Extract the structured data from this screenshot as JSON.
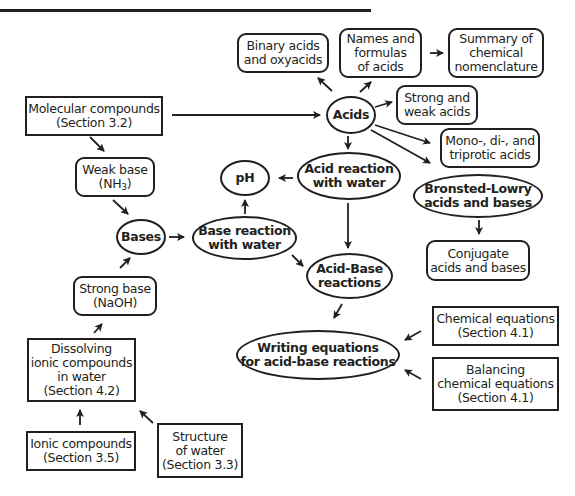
{
  "diagram": {
    "type": "concept-map",
    "nodes": {
      "binary_acids": "Binary acids\nand oxyacids",
      "names_formulas": "Names and\nformulas\nof acids",
      "summary_nomenclature": "Summary of\nchemical\nnomenclature",
      "molecular_compounds": "Molecular compounds\n(Section 3.2)",
      "acids": "Acids",
      "strong_weak_acids": "Strong and\nweak acids",
      "weak_base_label": "Weak base",
      "weak_base_formula_prefix": "(NH",
      "weak_base_formula_sub": "3",
      "weak_base_formula_suffix": ")",
      "ph": "pH",
      "acid_reaction_water": "Acid reaction\nwith water",
      "mono_di_triprotic": "Mono-, di-, and\ntriprotic acids",
      "bronsted_lowry": "Bronsted-Lowry\nacids and bases",
      "bases": "Bases",
      "base_reaction_water": "Base reaction\nwith water",
      "conjugate": "Conjugate\nacids and bases",
      "strong_base": "Strong base\n(NaOH)",
      "acid_base_reactions": "Acid-Base\nreactions",
      "chemical_equations": "Chemical equations\n(Section 4.1)",
      "dissolving_ionic": "Dissolving\nionic compounds\nin water\n(Section 4.2)",
      "writing_equations": "Writing equations\nfor acid-base reactions",
      "balancing_equations": "Balancing\nchemical equations\n(Section 4.1)",
      "ionic_compounds": "Ionic compounds\n(Section 3.5)",
      "structure_water": "Structure\nof water\n(Section 3.3)"
    },
    "edges": [
      [
        "molecular_compounds",
        "acids"
      ],
      [
        "molecular_compounds",
        "weak_base"
      ],
      [
        "acids",
        "binary_acids"
      ],
      [
        "acids",
        "names_formulas"
      ],
      [
        "names_formulas",
        "summary_nomenclature"
      ],
      [
        "acids",
        "strong_weak_acids"
      ],
      [
        "acids",
        "mono_di_triprotic"
      ],
      [
        "acids",
        "bronsted_lowry"
      ],
      [
        "acids",
        "acid_reaction_water"
      ],
      [
        "acid_reaction_water",
        "ph"
      ],
      [
        "acid_reaction_water",
        "acid_base_reactions"
      ],
      [
        "bronsted_lowry",
        "conjugate"
      ],
      [
        "weak_base",
        "bases"
      ],
      [
        "strong_base",
        "bases"
      ],
      [
        "bases",
        "base_reaction_water"
      ],
      [
        "base_reaction_water",
        "ph"
      ],
      [
        "base_reaction_water",
        "acid_base_reactions"
      ],
      [
        "acid_base_reactions",
        "writing_equations"
      ],
      [
        "chemical_equations",
        "writing_equations"
      ],
      [
        "balancing_equations",
        "writing_equations"
      ],
      [
        "dissolving_ionic",
        "strong_base"
      ],
      [
        "ionic_compounds",
        "dissolving_ionic"
      ],
      [
        "structure_water",
        "dissolving_ionic"
      ]
    ]
  }
}
